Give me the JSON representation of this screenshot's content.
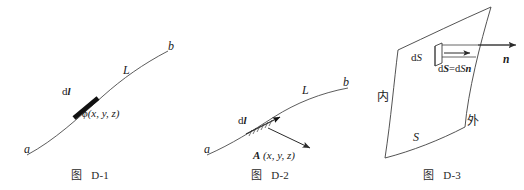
{
  "sheet": {
    "width": 524,
    "height": 190,
    "background": "#ffffff",
    "ink": "#1b1b1b"
  },
  "figures": [
    {
      "id": "D-1",
      "caption_prefix": "图",
      "caption_id": "D-1",
      "labels": {
        "start_point": "a",
        "end_point": "b",
        "curve": "L",
        "element": "d𝒙",
        "element_plain": "dl",
        "field": "ϕ(x, y, z)"
      }
    },
    {
      "id": "D-2",
      "caption_prefix": "图",
      "caption_id": "D-2",
      "labels": {
        "start_point": "a",
        "end_point": "b",
        "curve": "L",
        "element": "dl",
        "field": "A (x, y, z)"
      }
    },
    {
      "id": "D-3",
      "caption_prefix": "图",
      "caption_id": "D-3",
      "labels": {
        "surface": "S",
        "inside": "内",
        "outside": "外",
        "area_element": "dS",
        "vector_element": "dS=dSn",
        "vector_element_parts": {
          "bold_ds": "dS",
          "equals": "=",
          "scalar_ds": "dS",
          "normal": "n"
        },
        "normal": "n"
      }
    }
  ]
}
